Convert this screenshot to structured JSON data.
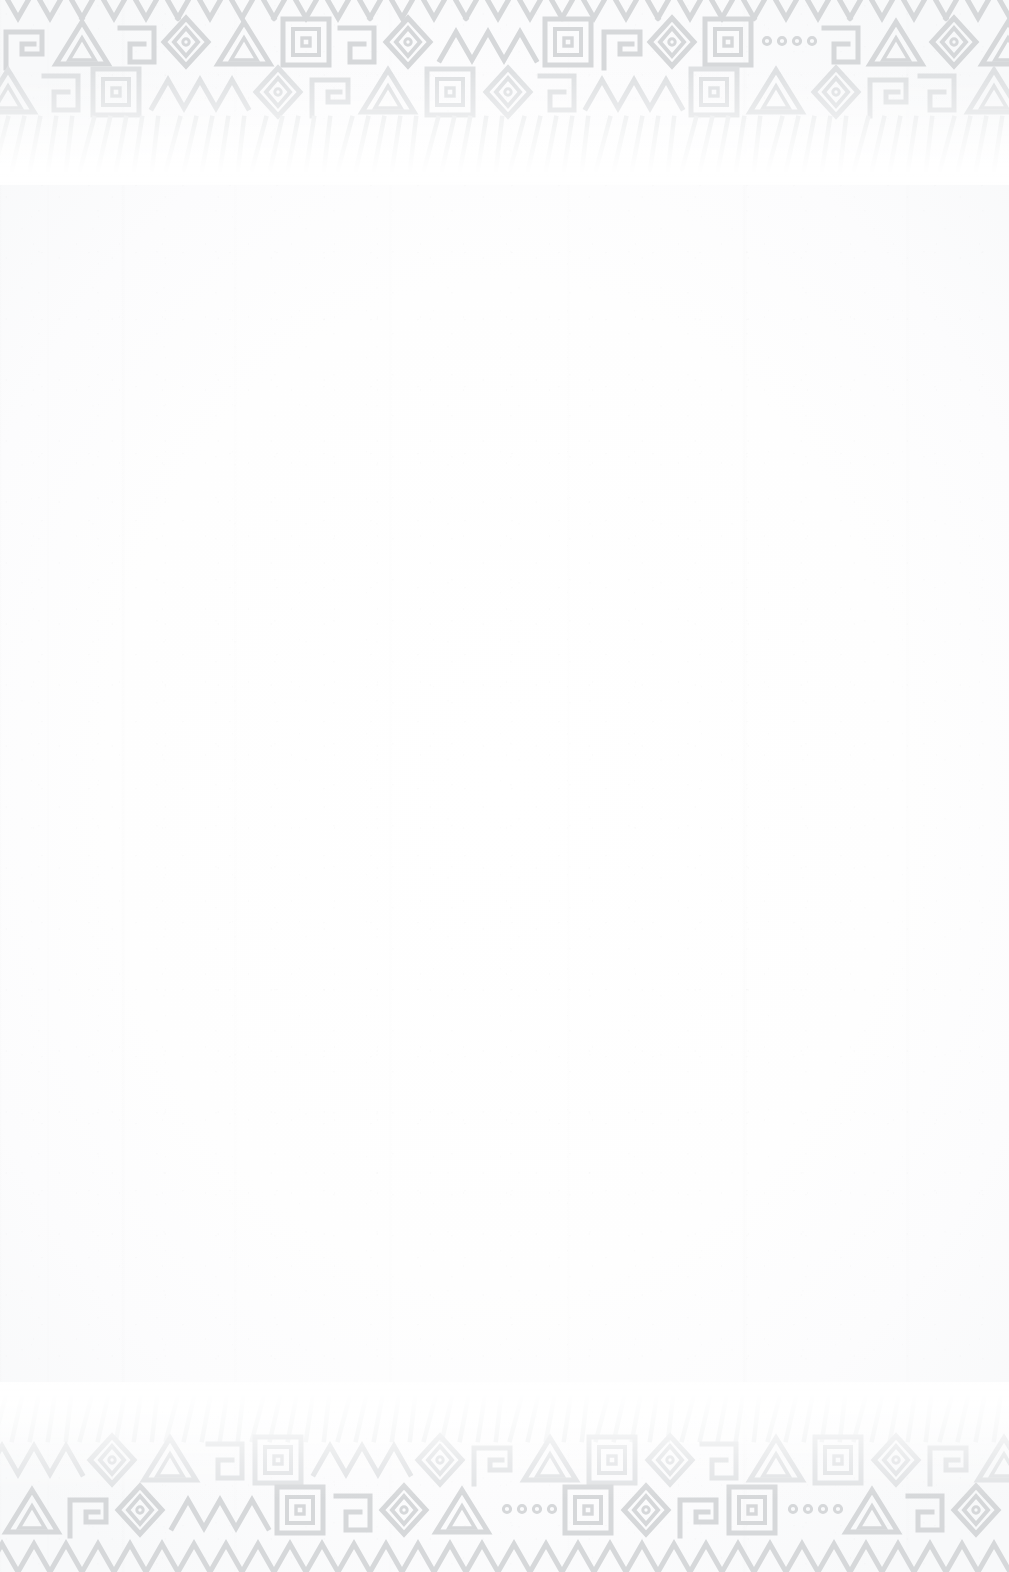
{
  "page": {
    "kind": "scanned-blank-page",
    "width": 1009,
    "height": 1572,
    "has_text": false,
    "body_text": "",
    "colors": {
      "paper": "#fefefe",
      "paper_edge": "#f8f9fa",
      "ornament_ink": "#d8dadc",
      "ornament_ink_light": "#e8eaec",
      "ornament_ink_faint": "#f1f2f3"
    }
  },
  "ornament": {
    "style": "andean-aztec-geometric-textile",
    "motifs": [
      "stepped-fret",
      "concentric-diamond",
      "concentric-square",
      "zigzag-chevron",
      "outlined-triangle",
      "angular-hook-spiral",
      "dot-row",
      "radiating-ray"
    ],
    "top_band": {
      "label": "Top decorative border",
      "y_start": 0,
      "y_end": 175,
      "bleeds_off_edge": true,
      "fade_direction": "downward"
    },
    "bottom_band": {
      "label": "Bottom decorative border",
      "y_start": 1395,
      "y_end": 1572,
      "bleeds_off_edge": true,
      "fade_direction": "upward"
    }
  }
}
